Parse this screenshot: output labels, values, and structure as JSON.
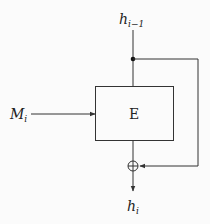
{
  "diagram": {
    "type": "block-cipher-compression-function",
    "nodes": {
      "input_chain": {
        "label": "h",
        "subscript": "i−1"
      },
      "message": {
        "label": "M",
        "subscript": "i"
      },
      "block": {
        "label": "E"
      },
      "xor": {
        "symbol": "⊕"
      },
      "output": {
        "label": "h",
        "subscript": "i"
      }
    },
    "edges": [
      {
        "from": "input_chain",
        "to": "block",
        "kind": "key-input"
      },
      {
        "from": "input_chain",
        "to": "xor",
        "kind": "feedforward"
      },
      {
        "from": "message",
        "to": "block",
        "kind": "plaintext-input"
      },
      {
        "from": "block",
        "to": "xor",
        "kind": "ciphertext"
      },
      {
        "from": "xor",
        "to": "output",
        "kind": "output"
      }
    ],
    "colors": {
      "line": "#333333",
      "background": "#fbfbfb"
    }
  }
}
